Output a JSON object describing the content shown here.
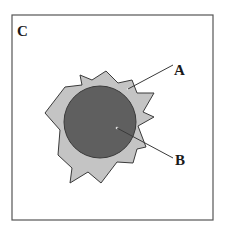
{
  "panel": {
    "label": "C",
    "frame_color": "#555555"
  },
  "diagram": {
    "callouts": [
      {
        "label": "A",
        "target": "outer-irregular-layer"
      },
      {
        "label": "B",
        "target": "inner-circle-core"
      }
    ],
    "colors": {
      "outer_fill": "#c4c4c4",
      "inner_fill": "#5f5f5f",
      "stroke": "#3a3a3a"
    }
  }
}
